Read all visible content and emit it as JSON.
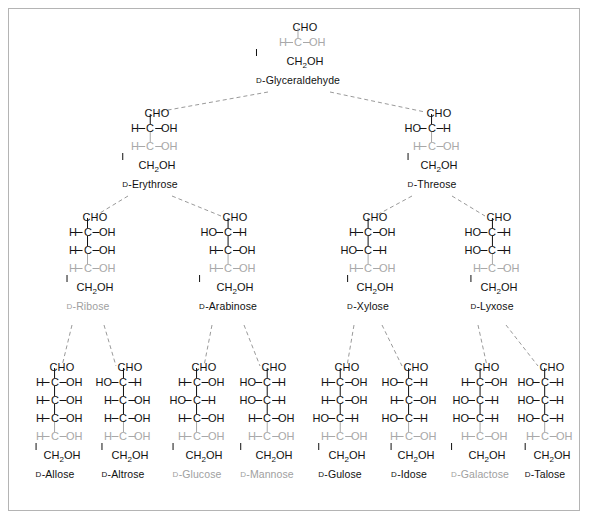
{
  "figure": {
    "background": "#ffffff",
    "frame_color": "#b4b4b4",
    "bond_color": "#111111",
    "faded_color": "#a8a8a8",
    "highlight_label_color": "#a0a0a0",
    "connector_style": "dashed",
    "connector_color": "#9a9a9a"
  },
  "labels": {
    "cho": "CHO",
    "ch2oh_c": "CH",
    "ch2oh_sub": "2",
    "ch2oh_oh": "OH",
    "h": "H",
    "oh": "OH",
    "ho": "HO",
    "c": "C",
    "d_prefix": "D"
  },
  "chart_data": {
    "type": "diagram",
    "rows": [
      {
        "carbons": 3,
        "names": [
          "D-Glyceraldehyde"
        ]
      },
      {
        "carbons": 4,
        "names": [
          "D-Erythrose",
          "D-Threose"
        ]
      },
      {
        "carbons": 5,
        "names": [
          "D-Ribose",
          "D-Arabinose",
          "D-Xylose",
          "D-Lyxose"
        ]
      },
      {
        "carbons": 6,
        "names": [
          "D-Allose",
          "D-Altrose",
          "D-Glucose",
          "D-Mannose",
          "D-Gulose",
          "D-Idose",
          "D-Galactose",
          "D-Talose"
        ]
      }
    ],
    "highlighted": [
      "D-Ribose",
      "D-Glucose",
      "D-Mannose",
      "D-Galactose"
    ],
    "note": "Each stereocenter listed top-to-bottom; 'R' = OH on right (H-C-OH), 'L' = OH on left (HO-C-H). The bottom-most stereocenter of every sugar is drawn faded gray as the shared D-configuration."
  },
  "sugars": [
    {
      "name": "D-Glyceraldehyde",
      "label": "Glyceraldehyde",
      "highlighted": false,
      "x": 298,
      "y": 22,
      "centers": [
        {
          "config": "R",
          "faded": true
        }
      ]
    },
    {
      "name": "D-Erythrose",
      "label": "Erythrose",
      "highlighted": false,
      "x": 150,
      "y": 108,
      "centers": [
        {
          "config": "R",
          "faded": false
        },
        {
          "config": "R",
          "faded": true
        }
      ]
    },
    {
      "name": "D-Threose",
      "label": "Threose",
      "highlighted": false,
      "x": 432,
      "y": 108,
      "centers": [
        {
          "config": "L",
          "faded": false
        },
        {
          "config": "R",
          "faded": true
        }
      ]
    },
    {
      "name": "D-Ribose",
      "label": "Ribose",
      "highlighted": true,
      "x": 88,
      "y": 212,
      "centers": [
        {
          "config": "R",
          "faded": false
        },
        {
          "config": "R",
          "faded": false
        },
        {
          "config": "R",
          "faded": true
        }
      ]
    },
    {
      "name": "D-Arabinose",
      "label": "Arabinose",
      "highlighted": false,
      "x": 228,
      "y": 212,
      "centers": [
        {
          "config": "L",
          "faded": false
        },
        {
          "config": "R",
          "faded": false
        },
        {
          "config": "R",
          "faded": true
        }
      ]
    },
    {
      "name": "D-Xylose",
      "label": "Xylose",
      "highlighted": false,
      "x": 368,
      "y": 212,
      "centers": [
        {
          "config": "R",
          "faded": false
        },
        {
          "config": "L",
          "faded": false
        },
        {
          "config": "R",
          "faded": true
        }
      ]
    },
    {
      "name": "D-Lyxose",
      "label": "Lyxose",
      "highlighted": false,
      "x": 492,
      "y": 212,
      "centers": [
        {
          "config": "L",
          "faded": false
        },
        {
          "config": "L",
          "faded": false
        },
        {
          "config": "R",
          "faded": true
        }
      ]
    },
    {
      "name": "D-Allose",
      "label": "Allose",
      "highlighted": false,
      "x": 55,
      "y": 362,
      "centers": [
        {
          "config": "R",
          "faded": false
        },
        {
          "config": "R",
          "faded": false
        },
        {
          "config": "R",
          "faded": false
        },
        {
          "config": "R",
          "faded": true
        }
      ]
    },
    {
      "name": "D-Altrose",
      "label": "Altrose",
      "highlighted": false,
      "x": 123,
      "y": 362,
      "centers": [
        {
          "config": "L",
          "faded": false
        },
        {
          "config": "R",
          "faded": false
        },
        {
          "config": "R",
          "faded": false
        },
        {
          "config": "R",
          "faded": true
        }
      ]
    },
    {
      "name": "D-Glucose",
      "label": "Glucose",
      "highlighted": true,
      "x": 197,
      "y": 362,
      "centers": [
        {
          "config": "R",
          "faded": false
        },
        {
          "config": "L",
          "faded": false
        },
        {
          "config": "R",
          "faded": false
        },
        {
          "config": "R",
          "faded": true
        }
      ]
    },
    {
      "name": "D-Mannose",
      "label": "Mannose",
      "highlighted": true,
      "x": 267,
      "y": 362,
      "centers": [
        {
          "config": "L",
          "faded": false
        },
        {
          "config": "L",
          "faded": false
        },
        {
          "config": "R",
          "faded": false
        },
        {
          "config": "R",
          "faded": true
        }
      ]
    },
    {
      "name": "D-Gulose",
      "label": "Gulose",
      "highlighted": false,
      "x": 340,
      "y": 362,
      "centers": [
        {
          "config": "R",
          "faded": false
        },
        {
          "config": "R",
          "faded": false
        },
        {
          "config": "L",
          "faded": false
        },
        {
          "config": "R",
          "faded": true
        }
      ]
    },
    {
      "name": "D-Idose",
      "label": "Idose",
      "highlighted": false,
      "x": 409,
      "y": 362,
      "centers": [
        {
          "config": "L",
          "faded": false
        },
        {
          "config": "R",
          "faded": false
        },
        {
          "config": "L",
          "faded": false
        },
        {
          "config": "R",
          "faded": true
        }
      ]
    },
    {
      "name": "D-Galactose",
      "label": "Galactose",
      "highlighted": true,
      "x": 480,
      "y": 362,
      "centers": [
        {
          "config": "R",
          "faded": false
        },
        {
          "config": "L",
          "faded": false
        },
        {
          "config": "L",
          "faded": false
        },
        {
          "config": "R",
          "faded": true
        }
      ]
    },
    {
      "name": "D-Talose",
      "label": "Talose",
      "highlighted": false,
      "x": 545,
      "y": 362,
      "centers": [
        {
          "config": "L",
          "faded": false
        },
        {
          "config": "L",
          "faded": false
        },
        {
          "config": "L",
          "faded": false
        },
        {
          "config": "R",
          "faded": true
        }
      ]
    }
  ],
  "connectors": [
    {
      "from": "D-Glyceraldehyde",
      "to": "D-Erythrose",
      "x1": 268,
      "y1": 92,
      "x2": 157,
      "y2": 112
    },
    {
      "from": "D-Glyceraldehyde",
      "to": "D-Threose",
      "x1": 330,
      "y1": 92,
      "x2": 425,
      "y2": 112
    },
    {
      "from": "D-Erythrose",
      "to": "D-Ribose",
      "x1": 128,
      "y1": 196,
      "x2": 95,
      "y2": 216
    },
    {
      "from": "D-Erythrose",
      "to": "D-Arabinose",
      "x1": 172,
      "y1": 196,
      "x2": 221,
      "y2": 216
    },
    {
      "from": "D-Threose",
      "to": "D-Xylose",
      "x1": 412,
      "y1": 196,
      "x2": 375,
      "y2": 216
    },
    {
      "from": "D-Threose",
      "to": "D-Lyxose",
      "x1": 452,
      "y1": 196,
      "x2": 485,
      "y2": 216
    },
    {
      "from": "D-Ribose",
      "to": "D-Allose",
      "x1": 72,
      "y1": 325,
      "x2": 62,
      "y2": 366
    },
    {
      "from": "D-Ribose",
      "to": "D-Altrose",
      "x1": 104,
      "y1": 325,
      "x2": 116,
      "y2": 366
    },
    {
      "from": "D-Arabinose",
      "to": "D-Glucose",
      "x1": 212,
      "y1": 325,
      "x2": 204,
      "y2": 366
    },
    {
      "from": "D-Arabinose",
      "to": "D-Mannose",
      "x1": 244,
      "y1": 325,
      "x2": 260,
      "y2": 366
    },
    {
      "from": "D-Xylose",
      "to": "D-Gulose",
      "x1": 354,
      "y1": 325,
      "x2": 347,
      "y2": 366
    },
    {
      "from": "D-Xylose",
      "to": "D-Idose",
      "x1": 382,
      "y1": 325,
      "x2": 402,
      "y2": 366
    },
    {
      "from": "D-Lyxose",
      "to": "D-Galactose",
      "x1": 478,
      "y1": 325,
      "x2": 487,
      "y2": 366
    },
    {
      "from": "D-Lyxose",
      "to": "D-Talose",
      "x1": 506,
      "y1": 325,
      "x2": 538,
      "y2": 366
    }
  ]
}
